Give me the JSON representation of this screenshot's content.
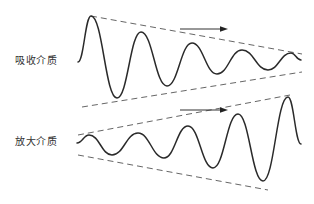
{
  "diagram": {
    "title": "",
    "panels": [
      {
        "id": "absorbing",
        "label": "吸收介质",
        "wave_behavior": "decaying",
        "direction": "right",
        "arrow": {
          "x1": 180,
          "y1": 29,
          "x2": 228,
          "y2": 29
        },
        "wave_points": [
          [
            78,
            62
          ],
          [
            91,
            16
          ],
          [
            117,
            98
          ],
          [
            141,
            32
          ],
          [
            167,
            86
          ],
          [
            192,
            43
          ],
          [
            217,
            74
          ],
          [
            242,
            50
          ],
          [
            268,
            70
          ],
          [
            291,
            53
          ],
          [
            301,
            60
          ]
        ],
        "envelope_upper": [
          [
            91,
            16
          ],
          [
            302,
            54
          ]
        ],
        "envelope_lower": [
          [
            82,
            107
          ],
          [
            302,
            72
          ]
        ]
      },
      {
        "id": "amplifying",
        "label": "放大介质",
        "wave_behavior": "growing",
        "direction": "right",
        "arrow": {
          "x1": 180,
          "y1": 110,
          "x2": 228,
          "y2": 110
        },
        "wave_points": [
          [
            77,
            143
          ],
          [
            89,
            135
          ],
          [
            112,
            155
          ],
          [
            138,
            133
          ],
          [
            164,
            158
          ],
          [
            188,
            126
          ],
          [
            213,
            168
          ],
          [
            238,
            114
          ],
          [
            263,
            181
          ],
          [
            288,
            97
          ],
          [
            301,
            144
          ]
        ],
        "envelope_upper": [
          [
            78,
            135
          ],
          [
            290,
            95
          ]
        ],
        "envelope_lower": [
          [
            78,
            155
          ],
          [
            268,
            190
          ]
        ]
      }
    ],
    "colors": {
      "wave": "#2a2a2a",
      "envelope": "#555555",
      "arrow": "#333333",
      "text": "#333333",
      "background": "#ffffff"
    }
  }
}
